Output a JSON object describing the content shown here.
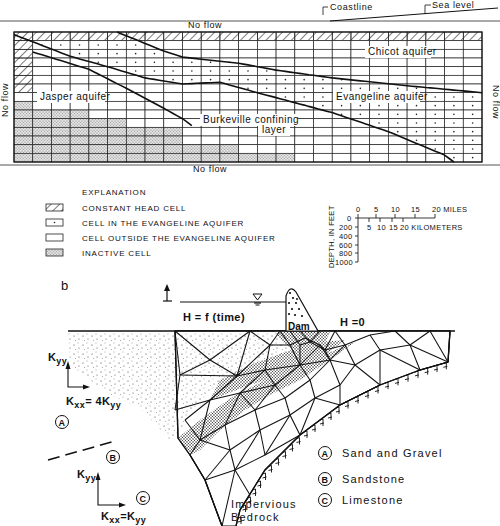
{
  "panel_a": {
    "labels": {
      "coastline": "Coastline",
      "sea_level": "Sea level",
      "no_flow_top": "No flow",
      "no_flow_bottom": "No flow",
      "no_flow_left": "No flow",
      "no_flow_right": "No flow",
      "chicot": "Chicot aquifer",
      "evangeline": "Evangeline aquifer",
      "jasper": "Jasper aquifer",
      "burkeville_1": "Burkeville confining",
      "burkeville_2": "layer"
    },
    "grid": {
      "columns": 25,
      "rows": 15
    }
  },
  "explanation": {
    "title": "EXPLANATION",
    "items": [
      {
        "symbol": "hatched",
        "label": "CONSTANT HEAD CELL"
      },
      {
        "symbol": "dot",
        "label": "CELL IN THE EVANGELINE AQUIFER"
      },
      {
        "symbol": "blank",
        "label": "CELL OUTSIDE THE EVANGELINE AQUIFER"
      },
      {
        "symbol": "stipple",
        "label": "INACTIVE CELL"
      }
    ]
  },
  "scale": {
    "miles_ticks": [
      "0",
      "5",
      "10",
      "15",
      "20 MILES"
    ],
    "km_ticks": [
      "5",
      "10",
      "15",
      "20 KILOMETERS"
    ],
    "depth_label": "DEPTH, IN FEET",
    "depth_ticks": [
      "0",
      "200",
      "400",
      "600",
      "800",
      "1000"
    ]
  },
  "panel_b": {
    "panel_letter": "b",
    "head_left": "H = f (time)",
    "head_right": "H =0",
    "dam": "Dam",
    "kyy_top": "K",
    "kyy_top_sub": "yy",
    "kxx_top": "K",
    "kxx_top_sub": "xx",
    "kxx_top_eq": "= 4K",
    "kxx_top_eq_sub": "yy",
    "kyy_bottom": "K",
    "kyy_bottom_sub": "yy",
    "kxx_bottom": "K",
    "kxx_bottom_sub": "xx",
    "kxx_bottom_eq": "=K",
    "kxx_bottom_eq_sub": "yy",
    "zone_a": "A",
    "zone_b": "B",
    "zone_c": "C",
    "bedrock_1": "Impervious",
    "bedrock_2": "Bedrock",
    "legend": [
      {
        "key": "A",
        "label": "Sand and Gravel"
      },
      {
        "key": "B",
        "label": "Sandstone"
      },
      {
        "key": "C",
        "label": "Limestone"
      }
    ]
  }
}
